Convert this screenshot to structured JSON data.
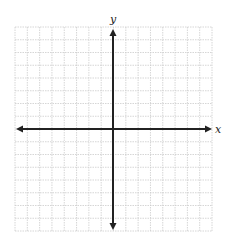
{
  "diagram": {
    "type": "coordinate-plane",
    "grid": {
      "columns": 16,
      "rows": 16,
      "left": 15,
      "top": 27,
      "right": 212,
      "bottom": 231,
      "line_color": "#cccccc"
    },
    "origin": {
      "x": 113,
      "y": 129
    },
    "axes": {
      "color": "#222222",
      "x_axis": {
        "label": "x",
        "from": 16,
        "to": 212
      },
      "y_axis": {
        "label": "y",
        "from": 29,
        "to": 230
      }
    }
  }
}
